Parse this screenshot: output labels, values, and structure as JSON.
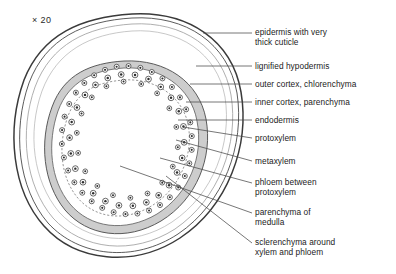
{
  "figure": {
    "magnification": "× 20",
    "type": "botanical-cross-section"
  },
  "labels": [
    {
      "id": "epidermis",
      "text": "epidermis with very\nthick cuticle",
      "x": 255,
      "y": 28
    },
    {
      "id": "hypodermis",
      "text": "lignified hypodermis",
      "x": 255,
      "y": 62
    },
    {
      "id": "outer-cortex",
      "text": "outer cortex, chlorenchyma",
      "x": 255,
      "y": 80
    },
    {
      "id": "inner-cortex",
      "text": "inner cortex, parenchyma",
      "x": 255,
      "y": 98
    },
    {
      "id": "endodermis",
      "text": "endodermis",
      "x": 255,
      "y": 116
    },
    {
      "id": "protoxylem",
      "text": "protoxylem",
      "x": 255,
      "y": 134
    },
    {
      "id": "metaxylem",
      "text": "metaxylem",
      "x": 255,
      "y": 157
    },
    {
      "id": "phloem",
      "text": "phloem between\nprotoxylem",
      "x": 255,
      "y": 178
    },
    {
      "id": "medulla",
      "text": "parenchyma of\nmedulla",
      "x": 255,
      "y": 208
    },
    {
      "id": "sclerenchyma",
      "text": "sclerenchyma around\nxylem and phloem",
      "x": 255,
      "y": 238
    }
  ],
  "colors": {
    "ink": "#1b1b1b",
    "outline": "#3a3a3a",
    "faint": "#9a9a9a",
    "band": "#bdbdbd",
    "leader": "#4a4a4a",
    "background": "#ffffff"
  },
  "leaders": [
    {
      "id": "leader-epidermis",
      "x1": 252,
      "y1": 33,
      "x2": 203,
      "y2": 33
    },
    {
      "id": "leader-hypodermis",
      "x1": 252,
      "y1": 66,
      "x2": 196,
      "y2": 66
    },
    {
      "id": "leader-outer-cortex",
      "x1": 252,
      "y1": 84,
      "x2": 190,
      "y2": 84
    },
    {
      "id": "leader-inner-cortex",
      "x1": 252,
      "y1": 102,
      "x2": 186,
      "y2": 102
    },
    {
      "id": "leader-endodermis",
      "x1": 252,
      "y1": 120,
      "x2": 178,
      "y2": 120
    },
    {
      "id": "leader-protoxylem",
      "x1": 252,
      "y1": 138,
      "x2": 183,
      "y2": 127
    },
    {
      "id": "leader-metaxylem",
      "x1": 252,
      "y1": 161,
      "x2": 176,
      "y2": 140
    },
    {
      "id": "leader-phloem",
      "x1": 252,
      "y1": 183,
      "x2": 160,
      "y2": 158
    },
    {
      "id": "leader-medulla",
      "x1": 252,
      "y1": 213,
      "x2": 120,
      "y2": 166
    },
    {
      "id": "leader-sclerenchyma",
      "x1": 252,
      "y1": 243,
      "x2": 166,
      "y2": 176
    }
  ]
}
